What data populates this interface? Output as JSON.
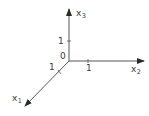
{
  "diagram": {
    "type": "3d-coordinate-axes",
    "colors": {
      "axis": "#3a3a3a",
      "text": "#3a3a3a",
      "background": "#ffffff"
    },
    "origin_label": "0",
    "axes": [
      {
        "name": "x1",
        "base": "x",
        "subscript": "1",
        "direction": "down-left",
        "tick_label": "1"
      },
      {
        "name": "x2",
        "base": "x",
        "subscript": "2",
        "direction": "right",
        "tick_label": "1"
      },
      {
        "name": "x3",
        "base": "x",
        "subscript": "3",
        "direction": "up",
        "tick_label": "1"
      }
    ]
  }
}
